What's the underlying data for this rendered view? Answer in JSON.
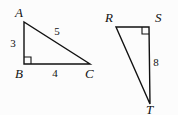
{
  "figure": {
    "background_color": "#fcfcfc",
    "stroke_color": "#111111",
    "triangles": [
      {
        "name": "triangle-abc",
        "vertices": [
          {
            "label": "A",
            "x": 24,
            "y": 22,
            "label_x": 15,
            "label_y": 17
          },
          {
            "label": "B",
            "x": 24,
            "y": 64,
            "label_x": 15,
            "label_y": 78
          },
          {
            "label": "C",
            "x": 90,
            "y": 64,
            "label_x": 85,
            "label_y": 78
          }
        ],
        "sides": [
          {
            "label": "3",
            "x": 13,
            "y": 47
          },
          {
            "label": "5",
            "x": 57,
            "y": 35
          },
          {
            "label": "4",
            "x": 55,
            "y": 77
          }
        ],
        "right_angle_at": "B"
      },
      {
        "name": "triangle-rst",
        "vertices": [
          {
            "label": "R",
            "x": 116,
            "y": 27,
            "label_x": 105,
            "label_y": 22
          },
          {
            "label": "S",
            "x": 149,
            "y": 27,
            "label_x": 155,
            "label_y": 22
          },
          {
            "label": "T",
            "x": 150,
            "y": 104,
            "label_x": 146,
            "label_y": 114
          }
        ],
        "sides": [
          {
            "label": "8",
            "x": 156,
            "y": 66
          }
        ],
        "right_angle_at": "S"
      }
    ]
  }
}
